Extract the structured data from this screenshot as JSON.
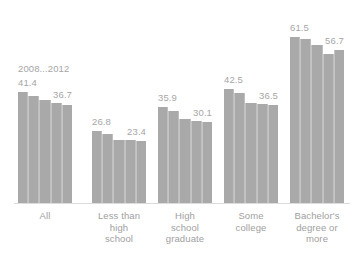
{
  "chart_data": {
    "type": "bar",
    "title": "",
    "subtitle": "",
    "xlabel": "",
    "ylabel": "",
    "ylim": [
      0,
      66
    ],
    "grid": false,
    "legend_position": "none",
    "series_caption": "2008...2012",
    "series": [
      {
        "name": "2008",
        "values": [
          41.4,
          26.8,
          35.9,
          42.5,
          61.5
        ]
      },
      {
        "name": "2009",
        "values": [
          40.0,
          25.7,
          34.4,
          41.1,
          60.8
        ]
      },
      {
        "name": "2010",
        "values": [
          38.3,
          23.8,
          31.2,
          37.3,
          58.8
        ]
      },
      {
        "name": "2011",
        "values": [
          37.2,
          23.6,
          30.6,
          36.8,
          55.4
        ]
      },
      {
        "name": "2012",
        "values": [
          36.7,
          23.4,
          30.1,
          36.5,
          56.7
        ]
      }
    ],
    "categories": [
      "All",
      "Less than high school",
      "High school graduate",
      "Some college",
      "Bachelor's degree or more"
    ],
    "groups": [
      {
        "category": "All",
        "label_lines": [
          "All"
        ],
        "values": [
          41.4,
          40.0,
          38.3,
          37.2,
          36.7
        ],
        "first_label": "41.4",
        "last_label": "36.7"
      },
      {
        "category": "Less than high school",
        "label_lines": [
          "Less than",
          "high",
          "school"
        ],
        "values": [
          26.8,
          25.7,
          23.8,
          23.6,
          23.4
        ],
        "first_label": "26.8",
        "last_label": "23.4"
      },
      {
        "category": "High school graduate",
        "label_lines": [
          "High",
          "school",
          "graduate"
        ],
        "values": [
          35.9,
          34.4,
          31.2,
          30.6,
          30.1
        ],
        "first_label": "35.9",
        "last_label": "30.1"
      },
      {
        "category": "Some college",
        "label_lines": [
          "Some",
          "college"
        ],
        "values": [
          42.5,
          41.1,
          37.3,
          36.8,
          36.5
        ],
        "first_label": "42.5",
        "last_label": "36.5"
      },
      {
        "category": "Bachelor's degree or more",
        "label_lines": [
          "Bachelor's",
          "degree or",
          "more"
        ],
        "values": [
          61.5,
          60.8,
          58.8,
          55.4,
          56.7
        ],
        "first_label": "61.5",
        "last_label": "56.7"
      }
    ],
    "colors": {
      "bar": "#a9a9a9",
      "bar_separator": "#c4c4c4",
      "label_text": "#a6a6a6",
      "category_text": "#a0a0a0",
      "axis_line": "#dcdcdc",
      "background": "#ffffff"
    }
  }
}
